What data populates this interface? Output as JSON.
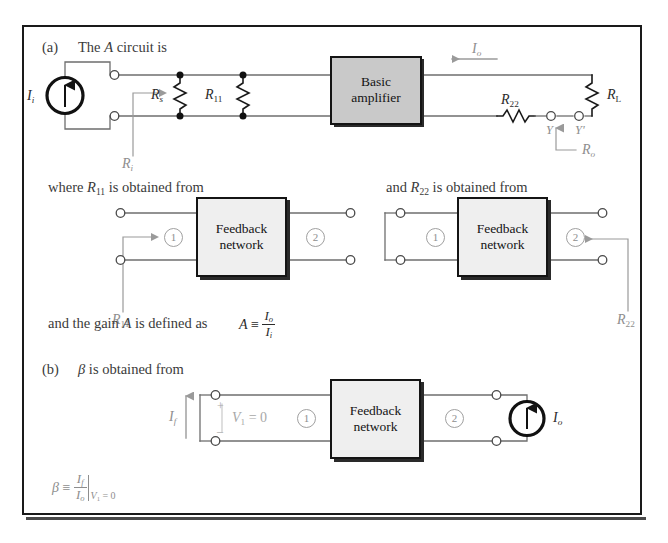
{
  "figure": {
    "background": "#ffffff",
    "frame_color": "#1a1a1a",
    "amplifier_fill": "#c9c9c9",
    "feedback_fill": "#efefef",
    "wire_color": "#6e6e6e",
    "faint_text_color": "#8e8e8e"
  },
  "section_a": {
    "part_label": "(a)",
    "intro_prefix": "The ",
    "intro_var": "A",
    "intro_suffix": " circuit is",
    "source_label": "I",
    "source_sub": "i",
    "rs_label": "R",
    "rs_sub": "s",
    "r11_label": "R",
    "r11_sub": "11",
    "amplifier_line1": "Basic",
    "amplifier_line2": "amplifier",
    "io_label": "I",
    "io_sub": "o",
    "r22_label": "R",
    "r22_sub": "22",
    "rl_label": "R",
    "rl_sub": "L",
    "ri_label": "R",
    "ri_sub": "i",
    "ro_label": "R",
    "ro_sub": "o",
    "node_y": "Y",
    "node_yprime": "Y'"
  },
  "section_r11": {
    "caption_prefix": "where ",
    "caption_var": "R",
    "caption_var_sub": "11",
    "caption_suffix": " is obtained from",
    "box_line1": "Feedback",
    "box_line2": "network",
    "port1": "1",
    "port2": "2",
    "pointer_label": "R",
    "pointer_sub": "11"
  },
  "section_r22": {
    "caption_prefix": "and ",
    "caption_var": "R",
    "caption_var_sub": "22",
    "caption_suffix": " is obtained from",
    "box_line1": "Feedback",
    "box_line2": "network",
    "port1": "1",
    "port2": "2",
    "pointer_label": "R",
    "pointer_sub": "22"
  },
  "gain_definition": {
    "text_prefix": "and the gain ",
    "text_var": "A",
    "text_suffix": " is defined as",
    "symbol": "A",
    "equals": "≡",
    "numerator": "I",
    "numerator_sub": "o",
    "denominator": "I",
    "denominator_sub": "i"
  },
  "section_b": {
    "part_label": "(b)",
    "intro_var": "β",
    "intro_suffix": " is obtained from",
    "if_label": "I",
    "if_sub": "f",
    "plus": "+",
    "minus": "–",
    "v1_label": "V",
    "v1_sub": "1",
    "v1_value": " = 0",
    "port1": "1",
    "port2": "2",
    "box_line1": "Feedback",
    "box_line2": "network",
    "io_label": "I",
    "io_sub": "o"
  },
  "beta_definition": {
    "symbol": "β",
    "equals": "≡",
    "numerator": "I",
    "numerator_sub": "f",
    "denominator": "I",
    "denominator_sub": "o",
    "condition_var": "V",
    "condition_sub": "1",
    "condition_value": " = 0"
  }
}
